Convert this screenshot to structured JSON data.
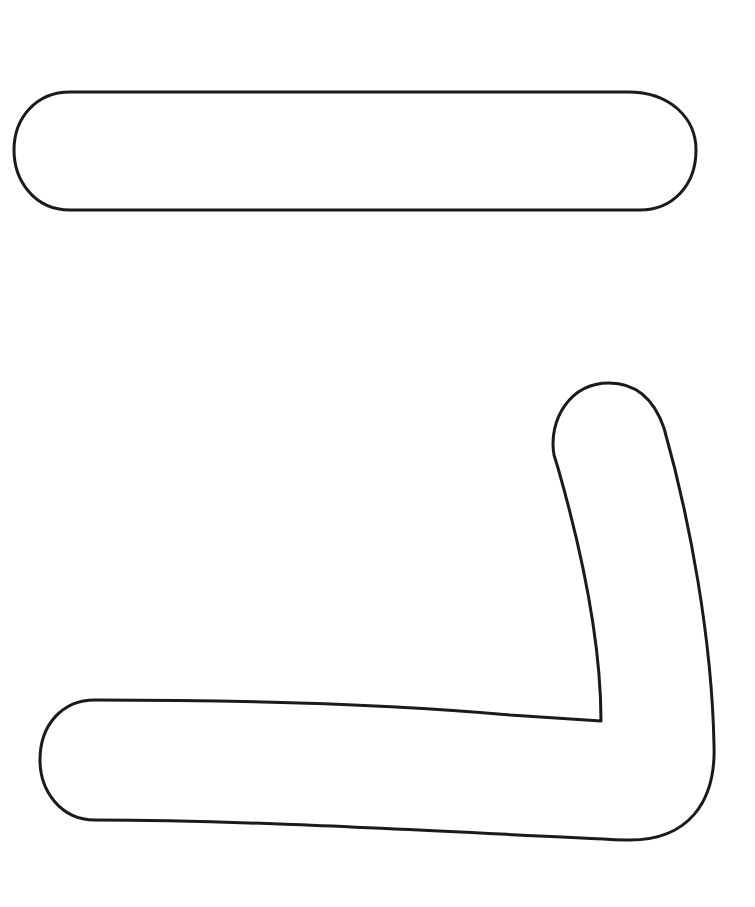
{
  "canvas": {
    "width": 755,
    "height": 907,
    "background": "#ffffff"
  },
  "style": {
    "stroke_color": "#1a1a1a",
    "fill_color": "#ffffff",
    "stroke_width": 3
  },
  "shapes": [
    {
      "id": "horizontal-pill",
      "kind": "rounded-bar-outline",
      "path": "M 70 92 L 628 92 C 670 92 696 118 696 150 C 696 186 672 210 640 210 L 70 210 C 34 210 14 180 14 150 C 14 118 36 92 70 92 Z"
    },
    {
      "id": "l-shape",
      "kind": "l-shaped-outline",
      "path": "M 554 455 C 548 420 570 383 609 383 C 640 383 656 405 664 428 C 690 520 712 640 714 745 C 716 800 690 842 625 840 C 450 832 250 820 95 820 C 60 820 40 790 40 760 C 40 725 62 700 95 700 C 250 700 400 705 510 715 L 601 721 C 601 640 580 545 558 468 Z"
    }
  ]
}
